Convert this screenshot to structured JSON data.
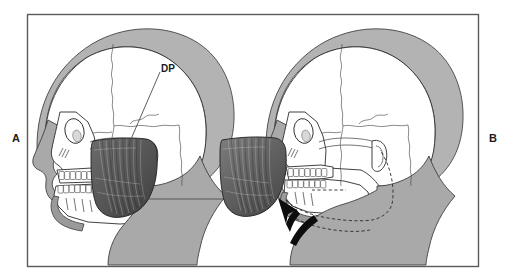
{
  "figure": {
    "background_color": "#ffffff",
    "frame_color": "#5a5a5a",
    "panels": [
      {
        "letter": "A",
        "description": "Lateral skull with masseter muscle, jaw at rest",
        "annotations": [
          {
            "label": "DP",
            "meaning": "deep portion of masseter"
          },
          {
            "label": "SP",
            "meaning": "superficial portion of masseter"
          }
        ]
      },
      {
        "letter": "B",
        "description": "Lateral skull with masseter contracted, mandible elevated, dashed outline shows previous position",
        "annotations": [
          {
            "label": "arrow",
            "meaning": "direction of mandibular elevation"
          }
        ]
      }
    ]
  },
  "labels": {
    "panel_a": "A",
    "panel_b": "B",
    "deep_portion": "DP",
    "superficial_portion": "SP"
  },
  "colors": {
    "bone": "#ffffff",
    "soft_tissue": "#a9a9a9",
    "scalp": "#b3b3b3",
    "muscle_deep": "#5c5c5c",
    "muscle_superficial": "#6e6e6e",
    "outline": "#2b2b2b",
    "arrow": "#0d0d0d"
  }
}
